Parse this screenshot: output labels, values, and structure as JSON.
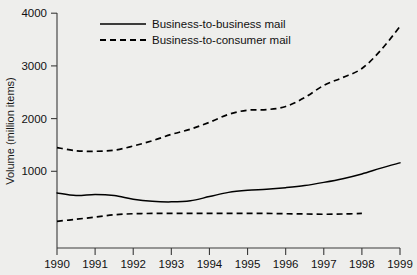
{
  "chart_data": {
    "type": "line",
    "title": "",
    "xlabel": "",
    "ylabel": "Volume (million items)",
    "xlim": [
      1990,
      1999
    ],
    "ylim": [
      0,
      4000
    ],
    "ytick_labels": [
      "1000",
      "2000",
      "3000",
      "4000"
    ],
    "yticks": [
      1000,
      2000,
      3000,
      4000
    ],
    "xtick_labels": [
      "1990",
      "1991",
      "1992",
      "1993",
      "1994",
      "1995",
      "1996",
      "1997",
      "1998",
      "1999"
    ],
    "xticks": [
      1990,
      1991,
      1992,
      1993,
      1994,
      1995,
      1996,
      1997,
      1998,
      1999
    ],
    "grid": false,
    "legend_position": "top-center",
    "x": [
      1990,
      1990.5,
      1991,
      1991.5,
      1992,
      1992.5,
      1993,
      1993.5,
      1994,
      1994.5,
      1995,
      1995.5,
      1996,
      1996.5,
      1997,
      1997.5,
      1998,
      1998.5,
      1999
    ],
    "series": [
      {
        "name": "Business-to-business mail",
        "style": "solid",
        "color": "#000000",
        "values": [
          590,
          540,
          560,
          540,
          470,
          430,
          420,
          440,
          520,
          600,
          640,
          660,
          690,
          730,
          790,
          860,
          950,
          1060,
          1160
        ]
      },
      {
        "name": "Business-to-consumer mail",
        "style": "dashed",
        "color": "#000000",
        "values": [
          1450,
          1390,
          1380,
          1400,
          1480,
          1580,
          1700,
          1800,
          1930,
          2080,
          2160,
          2170,
          2230,
          2400,
          2630,
          2780,
          2950,
          3300,
          3750
        ]
      },
      {
        "name": "lower-dashed-series",
        "style": "dashed",
        "color": "#000000",
        "values": [
          50,
          90,
          130,
          175,
          195,
          200,
          200,
          200,
          200,
          200,
          200,
          200,
          195,
          190,
          185,
          190,
          200,
          null,
          null
        ]
      }
    ],
    "legend_entries": [
      {
        "label": "Business-to-business mail",
        "style": "solid"
      },
      {
        "label": "Business-to-consumer mail",
        "style": "dashed"
      }
    ]
  }
}
